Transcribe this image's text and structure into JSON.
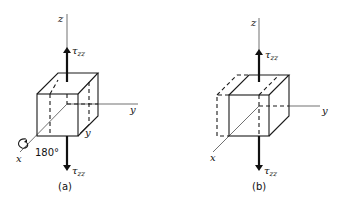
{
  "figure": {
    "panel_a": {
      "caption": "(a)",
      "axes": {
        "z": "z",
        "y": "y",
        "x": "x"
      },
      "stress_top": {
        "symbol": "τ",
        "subscript": "zz"
      },
      "stress_bottom": {
        "symbol": "τ",
        "subscript": "zz"
      },
      "rotation_label": "180°",
      "inner_label": "y"
    },
    "panel_b": {
      "caption": "(b)",
      "axes": {
        "z": "z",
        "y": "y",
        "x": "x"
      },
      "stress_top": {
        "symbol": "τ",
        "subscript": "zz"
      },
      "stress_bottom": {
        "symbol": "τ",
        "subscript": "zz"
      }
    }
  }
}
